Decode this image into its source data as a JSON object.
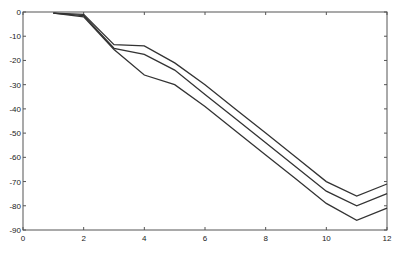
{
  "chart_data": {
    "type": "line",
    "title": "",
    "xlabel": "",
    "ylabel": "",
    "xlim": [
      0,
      12
    ],
    "ylim": [
      -90,
      0
    ],
    "grid": false,
    "legend": null,
    "x_ticks": [
      0,
      2,
      4,
      6,
      8,
      10,
      12
    ],
    "y_ticks": [
      0,
      -10,
      -20,
      -30,
      -40,
      -50,
      -60,
      -70,
      -80,
      -90
    ],
    "x": [
      1,
      2,
      3,
      4,
      5,
      6,
      7,
      8,
      9,
      10,
      11,
      12
    ],
    "series": [
      {
        "name": "upper",
        "color": "#333333",
        "values": [
          -0.5,
          -1,
          -13.5,
          -14,
          -21,
          -30,
          -40,
          -50,
          -60,
          -70,
          -76,
          -71
        ]
      },
      {
        "name": "middle",
        "color": "#333333",
        "values": [
          -0.5,
          -1.5,
          -15,
          -17.5,
          -24,
          -34,
          -44,
          -54,
          -64,
          -74,
          -80,
          -75
        ]
      },
      {
        "name": "lower",
        "color": "#333333",
        "values": [
          -0.5,
          -2,
          -15.5,
          -26,
          -30,
          -39,
          -49,
          -59,
          -69,
          -79,
          -86,
          -81
        ]
      }
    ]
  },
  "style": {
    "axis_color": "#555555",
    "line_color": "#333333",
    "background": "#ffffff"
  }
}
